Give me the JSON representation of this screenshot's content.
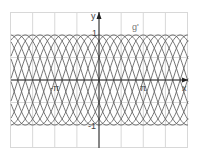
{
  "chart_data": {
    "type": "line",
    "title": "",
    "xlabel": "x",
    "ylabel": "y",
    "curve_label": "g'",
    "x_ticks": [
      {
        "label": "-π",
        "value": -3.1416
      },
      {
        "label": "π",
        "value": 3.1416
      }
    ],
    "y_ticks": [
      {
        "label": "1",
        "value": 1
      },
      {
        "label": "-1",
        "value": -1
      }
    ],
    "xlim": [
      -6.2832,
      6.2832
    ],
    "ylim": [
      -1.5,
      1.5
    ],
    "grid": true,
    "grid_step_x": 1.5708,
    "grid_step_y": 0.5,
    "series_description": "Family of shifted sinusoids y = sin(x + c), amplitude 1, period 2π",
    "phase_shifts": [
      0,
      0.5236,
      1.0472,
      1.5708,
      2.0944,
      2.618,
      3.1416,
      3.6652,
      4.1888,
      4.7124,
      5.236,
      5.7596
    ],
    "colors": {
      "curve": "#666666",
      "grid": "#d8d8d8",
      "axis": "#222222"
    }
  },
  "labels": {
    "x_axis": "x",
    "y_axis": "y",
    "curve": "g'",
    "x_neg_pi": "-π",
    "x_pi": "π",
    "y_one": "1",
    "y_neg_one": "-1"
  }
}
